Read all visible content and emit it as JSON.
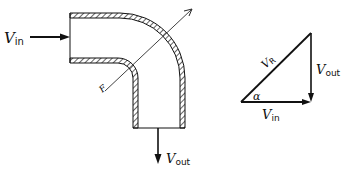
{
  "diagram": {
    "type": "pipe-bend-velocity-diagram",
    "pipe": {
      "description": "90-degree hatched pipe elbow, inflow horizontal from left, outflow vertical downward"
    },
    "labels": {
      "v_in_main": "V",
      "v_in_sub": "in",
      "v_out_main": "V",
      "v_out_sub": "out",
      "force": "F",
      "tri_vr_main": "V",
      "tri_vr_sub": "R",
      "tri_vout_main": "V",
      "tri_vout_sub": "out",
      "tri_vin_main": "V",
      "tri_vin_sub": "in",
      "tri_angle": "α"
    },
    "colors": {
      "stroke": "#111111",
      "background": "#ffffff"
    }
  }
}
